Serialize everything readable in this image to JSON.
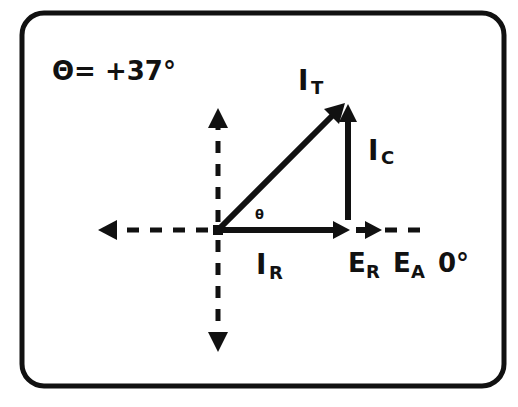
{
  "diagram": {
    "type": "phasor-diagram",
    "angle_label": "Θ= +37°",
    "theta_symbol": "θ",
    "phasors": {
      "total_current": {
        "main": "I",
        "sub": "T"
      },
      "capacitive_current": {
        "main": "I",
        "sub": "C"
      },
      "resistive_current": {
        "main": "I",
        "sub": "R"
      },
      "resistor_voltage": {
        "main": "E",
        "sub": "R"
      },
      "applied_voltage": {
        "main": "E",
        "sub": "A"
      }
    },
    "reference_angle": "0°",
    "colors": {
      "ink": "#111111",
      "background": "#ffffff"
    }
  }
}
